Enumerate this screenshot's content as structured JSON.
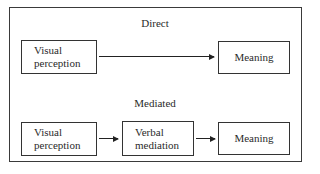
{
  "diagram": {
    "direct": {
      "heading": "Direct",
      "nodes": [
        {
          "line1": "Visual",
          "line2": "perception"
        },
        {
          "label": "Meaning"
        }
      ]
    },
    "mediated": {
      "heading": "Mediated",
      "nodes": [
        {
          "line1": "Visual",
          "line2": "perception"
        },
        {
          "line1": "Verbal",
          "line2": "mediation"
        },
        {
          "label": "Meaning"
        }
      ]
    },
    "edges": [
      {
        "from": "direct.visual_perception",
        "to": "direct.meaning"
      },
      {
        "from": "mediated.visual_perception",
        "to": "mediated.verbal_mediation"
      },
      {
        "from": "mediated.verbal_mediation",
        "to": "mediated.meaning"
      }
    ]
  }
}
